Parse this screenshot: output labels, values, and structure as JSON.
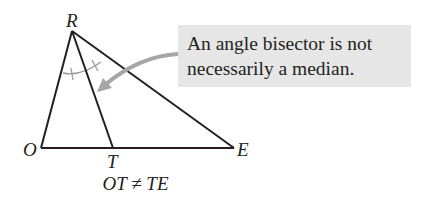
{
  "diagram": {
    "type": "triangle-angle-bisector",
    "vertices": {
      "R": {
        "label": "R",
        "x": 72,
        "y": 31
      },
      "O": {
        "label": "O",
        "x": 41,
        "y": 148
      },
      "T": {
        "label": "T",
        "x": 113,
        "y": 148
      },
      "E": {
        "label": "E",
        "x": 234,
        "y": 148
      }
    },
    "segments": [
      "RO",
      "RE",
      "OE",
      "RT"
    ],
    "bisector": "RT",
    "callout": {
      "line1": "An angle bisector is not",
      "line2": "necessarily a median.",
      "background": "#e6e6e6"
    },
    "caption": "OT ≠ TE",
    "colors": {
      "line": "#231f20",
      "arc": "#9a9a9a",
      "arrow": "#a6a6a6"
    }
  }
}
